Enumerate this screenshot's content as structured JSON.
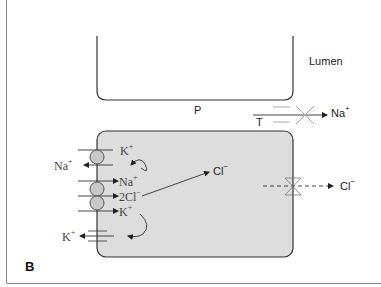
{
  "figure": {
    "panel_label": "B",
    "colors": {
      "cell_fill": "#dddddd",
      "pump_fill": "#c8c8c8",
      "stroke": "#333333",
      "frame": "#888888"
    },
    "labels": {
      "lumen": "Lumen",
      "paracellular": "P",
      "tight_junction": "T",
      "na_lumen": {
        "base": "Na",
        "sup": "+"
      },
      "k_pump": {
        "base": "K",
        "sup": "+"
      },
      "na_pump_out": {
        "base": "Na",
        "sup": "+"
      },
      "na_cotransport": {
        "base": "Na",
        "sup": "+"
      },
      "cl_cotransport": {
        "base": "2Cl",
        "sup": "−"
      },
      "k_cotransport": {
        "base": "K",
        "sup": "+"
      },
      "k_channel_out": {
        "base": "K",
        "sup": "+"
      },
      "cl_intracellular": {
        "base": "Cl",
        "sup": "−"
      },
      "cl_apical_out": {
        "base": "Cl",
        "sup": "−"
      }
    }
  }
}
